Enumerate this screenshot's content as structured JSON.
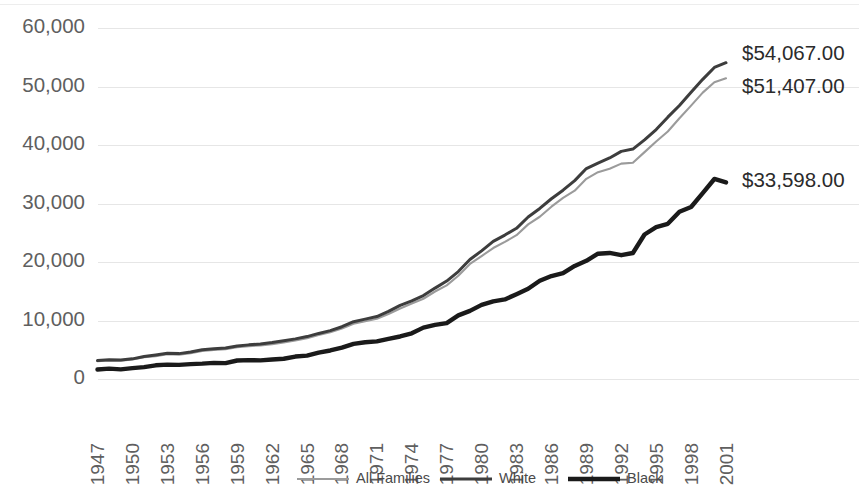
{
  "chart_data": {
    "type": "line",
    "title": "",
    "subtitle": "",
    "xlabel": "",
    "ylabel": "",
    "xlim": [
      1947,
      2001
    ],
    "ylim": [
      0,
      60000
    ],
    "grid": true,
    "legend_position": "bottom",
    "y_ticks": [
      0,
      10000,
      20000,
      30000,
      40000,
      50000,
      60000
    ],
    "y_tick_labels": [
      "0",
      "10,000",
      "20,000",
      "30,000",
      "40,000",
      "50,000",
      "60,000"
    ],
    "x_tick_labels": [
      "1947",
      "1950",
      "1953",
      "1956",
      "1959",
      "1962",
      "1965",
      "1968",
      "1971",
      "1974",
      "1977",
      "1980",
      "1983",
      "1986",
      "1989",
      "1992",
      "1995",
      "1998",
      "2001"
    ],
    "x": [
      1947,
      1948,
      1949,
      1950,
      1951,
      1952,
      1953,
      1954,
      1955,
      1956,
      1957,
      1958,
      1959,
      1960,
      1961,
      1962,
      1963,
      1964,
      1965,
      1966,
      1967,
      1968,
      1969,
      1970,
      1971,
      1972,
      1973,
      1974,
      1975,
      1976,
      1977,
      1978,
      1979,
      1980,
      1981,
      1982,
      1983,
      1984,
      1985,
      1986,
      1987,
      1988,
      1989,
      1990,
      1991,
      1992,
      1993,
      1994,
      1995,
      1996,
      1997,
      1998,
      1999,
      2000,
      2001
    ],
    "series": [
      {
        "name": "All Families",
        "color": "#9b9b9b",
        "width": 2.1,
        "end_label": "$51,407.00",
        "end_value": 51407,
        "values": [
          3031,
          3187,
          3107,
          3319,
          3709,
          3890,
          4233,
          4173,
          4421,
          4783,
          4971,
          5087,
          5417,
          5620,
          5735,
          5956,
          6249,
          6569,
          6957,
          7532,
          7974,
          8632,
          9433,
          9867,
          10285,
          11116,
          12051,
          12902,
          13719,
          14958,
          16009,
          17640,
          19661,
          21023,
          22388,
          23433,
          24580,
          26433,
          27735,
          29458,
          30970,
          32191,
          34213,
          35353,
          35939,
          36812,
          36959,
          38782,
          40611,
          42300,
          44568,
          46737,
          48950,
          50732,
          51407
        ]
      },
      {
        "name": "White",
        "color": "#3d3d3d",
        "width": 3.0,
        "end_label": "$54,067.00",
        "end_value": 54067,
        "values": [
          3157,
          3310,
          3232,
          3445,
          3859,
          4114,
          4392,
          4339,
          4605,
          4993,
          5166,
          5300,
          5643,
          5835,
          5981,
          6237,
          6548,
          6858,
          7251,
          7792,
          8274,
          8937,
          9794,
          10236,
          10672,
          11549,
          12595,
          13356,
          14268,
          15537,
          16740,
          18368,
          20439,
          21904,
          23517,
          24603,
          25757,
          27686,
          29152,
          30809,
          32274,
          33915,
          35975,
          36915,
          37783,
          38909,
          39300,
          40884,
          42646,
          44756,
          46754,
          49023,
          51224,
          53256,
          54067
        ]
      },
      {
        "name": "Black",
        "color": "#1a1a1a",
        "width": 4.4,
        "end_label": "$33,598.00",
        "end_value": 33598,
        "values": [
          1614,
          1768,
          1650,
          1869,
          2032,
          2338,
          2461,
          2410,
          2549,
          2628,
          2764,
          2711,
          3161,
          3233,
          3191,
          3330,
          3465,
          3839,
          3994,
          4507,
          4875,
          5360,
          5999,
          6279,
          6440,
          6864,
          7269,
          7808,
          8779,
          9242,
          9563,
          10879,
          11644,
          12674,
          13266,
          13598,
          14506,
          15432,
          16786,
          17604,
          18098,
          19329,
          20209,
          21423,
          21548,
          21161,
          21542,
          24698,
          25970,
          26522,
          28602,
          29404,
          31778,
          34192,
          33598
        ]
      }
    ]
  },
  "legend": {
    "items": [
      {
        "label": "All Families"
      },
      {
        "label": "White"
      },
      {
        "label": "Black"
      }
    ]
  }
}
